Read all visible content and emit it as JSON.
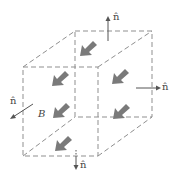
{
  "figure": {
    "labels": {
      "normal_top": "n̂",
      "normal_right": "n̂",
      "normal_left": "n̂",
      "normal_bottom": "n̂",
      "field": "B"
    },
    "colors": {
      "edge": "#8f8f8f",
      "field_arrow": "#7a7a7a",
      "normal_arrow": "#555555"
    },
    "cube": {
      "front_face": {
        "x1": 23,
        "y1": 67,
        "x2": 98,
        "y2": 156
      },
      "back_face": {
        "x1": 75,
        "y1": 31,
        "x2": 152,
        "y2": 117
      }
    },
    "field_arrows_count": 6
  }
}
